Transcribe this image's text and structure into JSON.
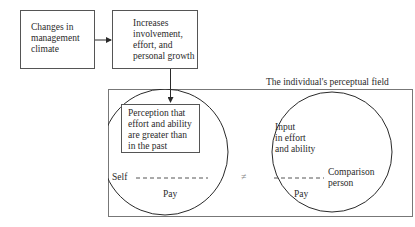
{
  "diagram": {
    "boxes": {
      "management_climate": {
        "text": "Changes in\nmanagement\nclimate"
      },
      "involvement": {
        "text": "Increases\ninvolvement,\neffort, and\npersonal growth"
      },
      "perception": {
        "text": "Perception that\neffort and ability\nare greater than\nin the past"
      }
    },
    "frame_label": "The individual's perceptual field",
    "left_circle": {
      "self_label": "Self",
      "pay_label": "Pay"
    },
    "right_circle": {
      "input_label": "Input\nin effort\nand ability",
      "comparison_label": "Comparison\nperson",
      "pay_label": "Pay"
    },
    "not_equal_symbol": "≠",
    "colors": {
      "line": "#2a2a2a",
      "frame": "#555555",
      "background": "#ffffff"
    }
  }
}
